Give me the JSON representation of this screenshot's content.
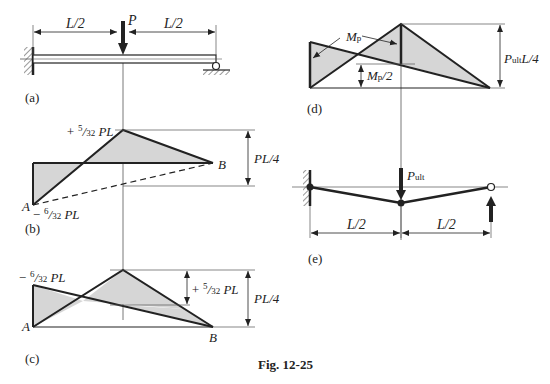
{
  "figure": {
    "caption": "Fig. 12-25",
    "colors": {
      "line": "#222222",
      "fill": "#d6d6d6",
      "guide": "#555555",
      "background": "#ffffff"
    }
  },
  "panels": {
    "a": {
      "tag": "(a)",
      "description": "Propped cantilever beam: fixed at left, roller at right, point load P at midspan",
      "load": "P",
      "span_left": "L/2",
      "span_right": "L/2"
    },
    "b": {
      "tag": "(b)",
      "description": "Elastic bending moment diagram",
      "positive_moment": {
        "sign": "+",
        "num": "5",
        "den": "32",
        "suffix": "PL"
      },
      "negative_moment": {
        "sign": "−",
        "num": "6",
        "den": "32",
        "suffix": "PL"
      },
      "free_moment": "PL/4",
      "point_a": "A",
      "point_b": "B"
    },
    "c": {
      "tag": "(c)",
      "description": "Superposition of free and reactant moment diagrams",
      "negative_moment": {
        "sign": "−",
        "num": "6",
        "den": "32",
        "suffix": "PL"
      },
      "positive_moment": {
        "sign": "+",
        "num": "5",
        "den": "32",
        "suffix": "PL"
      },
      "free_moment": "PL/4",
      "point_a": "A",
      "point_b": "B"
    },
    "d": {
      "tag": "(d)",
      "description": "Plastic collapse moment diagram",
      "plastic_moment": {
        "main": "M",
        "sub": "p"
      },
      "half_plastic_moment": {
        "main": "M",
        "sub": "p",
        "suffix": "/2"
      },
      "ultimate_free_moment": {
        "main": "P",
        "sub": "ult",
        "suffix": "L/4"
      }
    },
    "e": {
      "tag": "(e)",
      "description": "Collapse mechanism with plastic hinges",
      "load": {
        "main": "P",
        "sub": "ult"
      },
      "span_left": "L/2",
      "span_right": "L/2"
    }
  }
}
